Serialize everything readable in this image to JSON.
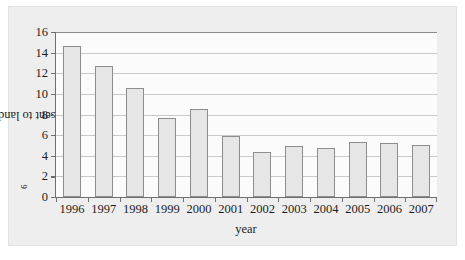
{
  "figure": {
    "background_color": "#eeeeee",
    "plot_background_color": "#fbfbfb",
    "bar_fill_color": "#e6e6e6",
    "bar_border_color": "#8d8d8d",
    "gridline_color": "#c9c9c9",
    "axis_color": "#6f6f6f",
    "text_color": "#1d1d1d"
  },
  "chart_data": {
    "type": "bar",
    "title": "",
    "xlabel": "year",
    "ylabel_text": "waste sent to landfill/lbs × 10",
    "ylabel_exponent": "6",
    "ylabel": "waste sent to landfill/lbs × 10⁶",
    "categories": [
      "1996",
      "1997",
      "1998",
      "1999",
      "2000",
      "2001",
      "2002",
      "2003",
      "2004",
      "2005",
      "2006",
      "2007"
    ],
    "values": [
      14.65,
      12.7,
      10.55,
      7.65,
      8.55,
      5.95,
      4.4,
      4.9,
      4.8,
      5.35,
      5.2,
      5.05
    ],
    "ylim": [
      0,
      16
    ],
    "ytick_values": [
      0,
      2,
      4,
      6,
      8,
      10,
      12,
      14,
      16
    ],
    "ytick_labels": [
      "0",
      "2",
      "4",
      "6",
      "8",
      "10",
      "12",
      "14",
      "16"
    ],
    "grid": true,
    "grid_axis": "y",
    "legend": false,
    "legend_position": "none"
  }
}
